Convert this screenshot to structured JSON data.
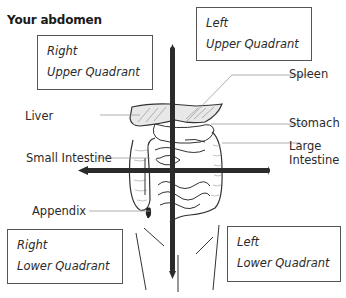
{
  "title": "Your abdomen",
  "quadrants": {
    "right_upper": {
      "line1": "Right",
      "line2": "Upper Quadrant"
    },
    "left_upper": {
      "line1": "Left",
      "line2": "Upper Quadrant"
    },
    "right_lower": {
      "line1": "Right",
      "line2": "Lower Quadrant"
    },
    "left_lower": {
      "line1": "Left",
      "line2": "Lower Quadrant"
    }
  },
  "labels": {
    "liver": "Liver",
    "small_intestine": "Small Intestine",
    "appendix": "Appendix",
    "spleen": "Spleen",
    "stomach": "Stomach",
    "large_intestine_1": "Large",
    "large_intestine_2": "Intestine"
  },
  "colors": {
    "axis": "#2b2b2b",
    "box_border": "#555555",
    "text": "#2a2a2a",
    "leader_line": "#999999"
  }
}
